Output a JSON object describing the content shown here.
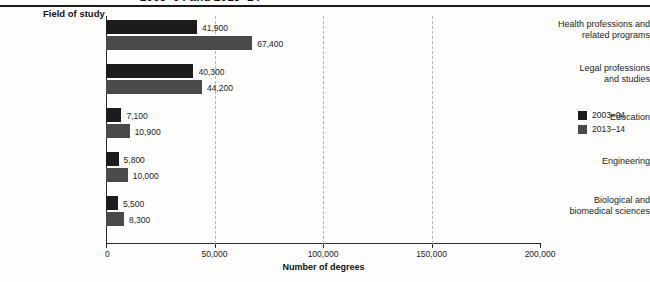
{
  "figure": {
    "title_cropped": "2003–04 and 2013–14",
    "group_header": "Field of study",
    "axis_title": "Number of degrees"
  },
  "legend": {
    "items": [
      {
        "label": "2003–04",
        "color": "#1c1c1c",
        "swatch": "legend-swatch-2003-04"
      },
      {
        "label": "2013–14",
        "color": "#4a4a4a",
        "swatch": "legend-swatch-2013-14"
      }
    ]
  },
  "axis": {
    "ticks": [
      "0",
      "50,000",
      "100,000",
      "150,000",
      "200,000"
    ],
    "tick_values": [
      0,
      50000,
      100000,
      150000,
      200000
    ],
    "gridlines_at": [
      50000,
      100000,
      150000
    ]
  },
  "chart_data": {
    "type": "bar",
    "orientation": "horizontal",
    "title": "2003–04 and 2013–14",
    "xlabel": "Number of degrees",
    "ylabel": "Field of study",
    "xlim": [
      0,
      200000
    ],
    "grid": true,
    "legend_position": "right",
    "categories": [
      "Health professions and related programs",
      "Legal professions and studies",
      "Education",
      "Engineering",
      "Biological and biomedical sciences"
    ],
    "category_lines": [
      [
        "Health professions and",
        "related programs"
      ],
      [
        "Legal professions",
        "and studies"
      ],
      [
        "Education"
      ],
      [
        "Engineering"
      ],
      [
        "Biological and",
        "biomedical sciences"
      ]
    ],
    "series": [
      {
        "name": "2003–04",
        "color": "#1c1c1c",
        "values": [
          41900,
          40300,
          7100,
          5800,
          5500
        ],
        "labels": [
          "41,900",
          "40,300",
          "7,100",
          "5,800",
          "5,500"
        ]
      },
      {
        "name": "2013–14",
        "color": "#4a4a4a",
        "values": [
          67400,
          44200,
          10900,
          10000,
          8300
        ],
        "labels": [
          "67,400",
          "44,200",
          "10,900",
          "10,000",
          "8,300"
        ]
      }
    ]
  }
}
